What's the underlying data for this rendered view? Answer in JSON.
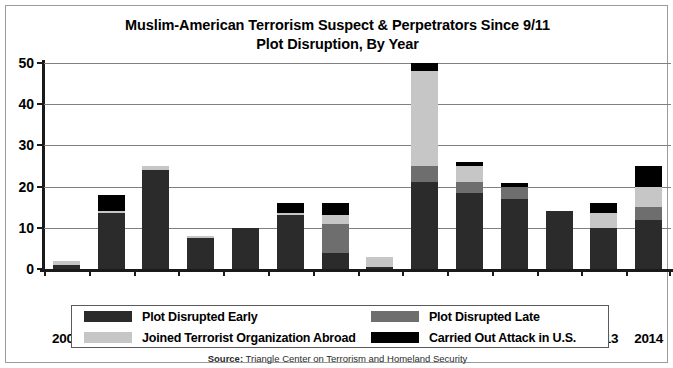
{
  "figure": {
    "title_line1": "Muslim-American Terrorism Suspect & Perpetrators Since 9/11",
    "title_line2": "Plot Disruption, By Year",
    "source_prefix": "Source:",
    "source_text": " Triangle Center on Terrorism and Homeland Security",
    "border_color": "#9a9a9a",
    "axis_color": "#1a1a1a",
    "grid_color": "#808080"
  },
  "chart_data": {
    "type": "bar",
    "stacked": true,
    "title": "Muslim-American Terrorism Suspect & Perpetrators Since 9/11 Plot Disruption, By Year",
    "xlabel": "",
    "ylabel": "",
    "ylim": [
      0,
      50
    ],
    "yticks": [
      0,
      10,
      20,
      30,
      40,
      50
    ],
    "ytick_labels": [
      "0",
      "10",
      "20",
      "30",
      "40",
      "50"
    ],
    "grid": true,
    "grid_axis": "y",
    "legend_position": "bottom",
    "categories": [
      "2001",
      "2002",
      "2003",
      "2004",
      "2005",
      "2006",
      "2007",
      "2008",
      "2009",
      "2010",
      "2011",
      "2012",
      "2013",
      "2014"
    ],
    "series": [
      {
        "name": "Plot Disrupted Early",
        "color": "#2b2b2b",
        "values": [
          1,
          13.5,
          24,
          7.5,
          10,
          13,
          4,
          0.5,
          21,
          18.5,
          17,
          14,
          10,
          12
        ]
      },
      {
        "name": "Plot Disrupted Late",
        "color": "#6e6e6e",
        "values": [
          0,
          0,
          0,
          0,
          0,
          0,
          7,
          0,
          4,
          2.5,
          3,
          0,
          0,
          3
        ]
      },
      {
        "name": "Joined Terrorist Organization Abroad",
        "color": "#c6c6c6",
        "values": [
          1,
          0.5,
          1,
          0.5,
          0,
          0.5,
          2,
          2.5,
          23,
          4,
          0,
          0,
          3.5,
          5
        ]
      },
      {
        "name": "Carried Out Attack in U.S.",
        "color": "#000000",
        "values": [
          0,
          4,
          0,
          0,
          0,
          2.5,
          3,
          0,
          2,
          1,
          1,
          0,
          2.5,
          5
        ]
      }
    ],
    "totals": [
      2,
      18,
      25,
      8,
      10,
      16,
      16,
      3,
      50,
      26,
      21,
      14,
      16,
      25
    ]
  },
  "legend": {
    "entries": [
      {
        "label": "Plot Disrupted Early",
        "swatch": "#2b2b2b"
      },
      {
        "label": "Plot Disrupted Late",
        "swatch": "#6e6e6e"
      },
      {
        "label": "Joined Terrorist Organization Abroad",
        "swatch": "#c6c6c6"
      },
      {
        "label": "Carried Out Attack in U.S.",
        "swatch": "#000000"
      }
    ]
  }
}
